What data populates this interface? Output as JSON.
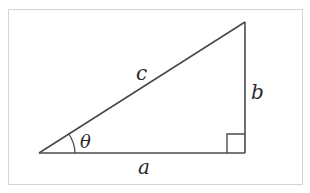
{
  "diagram": {
    "colors": {
      "stroke": "#4a4a4a",
      "frame": "#d4d4d4",
      "background": "#ffffff",
      "text": "#2a2a2a"
    },
    "vertices": {
      "left": [
        39,
        153
      ],
      "right_angle": [
        245,
        153
      ],
      "top": [
        245,
        22
      ]
    },
    "labels": {
      "hypotenuse": "c",
      "opposite": "b",
      "adjacent": "a",
      "angle": "θ"
    },
    "markers": {
      "angle_arc": "angle θ at left vertex",
      "right_angle_box": "right angle at bottom-right vertex"
    }
  }
}
